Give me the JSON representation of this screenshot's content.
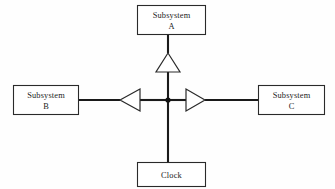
{
  "diagram": {
    "background_color": "#fefefe",
    "line_color": "#1a1a1a",
    "box_fill": "#ffffff",
    "box_stroke": "#2a2a2a",
    "junction_color": "#111111",
    "nodes": {
      "subsystem_a": {
        "label_line1": "Subsystem",
        "label_line2": "A"
      },
      "subsystem_b": {
        "label_line1": "Subsystem",
        "label_line2": "B"
      },
      "subsystem_c": {
        "label_line1": "Subsystem",
        "label_line2": "C"
      },
      "clock": {
        "label_line1": "Clock",
        "label_line2": ""
      }
    },
    "buffers": {
      "up": {
        "direction": "up"
      },
      "left": {
        "direction": "left"
      },
      "right": {
        "direction": "right"
      }
    }
  }
}
